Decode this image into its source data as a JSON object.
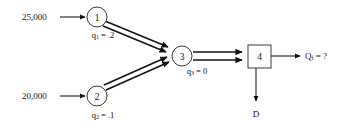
{
  "diagram": {
    "background_color": "#ffffff",
    "stroke_color": "#111111",
    "inputs": [
      {
        "id": "input-1",
        "value": "25,000",
        "target": "1"
      },
      {
        "id": "input-2",
        "value": "20,000",
        "target": "2"
      }
    ],
    "nodes": [
      {
        "id": "node-1",
        "label": "1",
        "shape": "circle",
        "param_symbol": "q",
        "param_subscript": "1",
        "param_text": "q1 = .2",
        "param_value": ".2",
        "param_equals": " = ",
        "cx": 97,
        "cy": 17,
        "r": 10
      },
      {
        "id": "node-2",
        "label": "2",
        "shape": "circle",
        "param_symbol": "q",
        "param_subscript": "2",
        "param_text": "q2 = .1",
        "param_value": ".1",
        "param_equals": " = ",
        "cx": 97,
        "cy": 96,
        "r": 10
      },
      {
        "id": "node-3",
        "label": "3",
        "shape": "circle",
        "param_symbol": "q",
        "param_subscript": "3",
        "param_text": "q3 = 0",
        "param_value": "0",
        "param_equals": " = ",
        "cx": 182,
        "cy": 56,
        "r": 10
      },
      {
        "id": "node-4",
        "label": "4",
        "shape": "square",
        "x": 248,
        "y": 45,
        "w": 23,
        "h": 23
      }
    ],
    "outputs": [
      {
        "id": "output-final",
        "symbol": "Q",
        "subscript": "f",
        "equals": " = ",
        "value": "?",
        "text": "Qf = ?"
      },
      {
        "id": "output-departure",
        "label": "D"
      }
    ],
    "edges": [
      {
        "from": "1",
        "to": "3",
        "style": "double"
      },
      {
        "from": "2",
        "to": "3",
        "style": "double"
      },
      {
        "from": "3",
        "to": "4",
        "style": "double"
      },
      {
        "from": "4",
        "to": "output-final",
        "style": "single"
      },
      {
        "from": "4",
        "to": "output-departure",
        "style": "single"
      }
    ]
  }
}
